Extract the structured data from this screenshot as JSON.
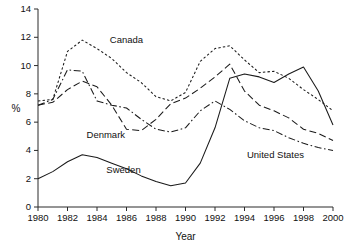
{
  "chart_data": {
    "type": "line",
    "title": "",
    "xlabel": "Year",
    "ylabel": "%",
    "xlim": [
      1980,
      2000
    ],
    "ylim": [
      0,
      14
    ],
    "grid": false,
    "legend_position": "inline-annotations",
    "x": [
      1980,
      1981,
      1982,
      1983,
      1984,
      1985,
      1986,
      1987,
      1988,
      1989,
      1990,
      1991,
      1992,
      1993,
      1994,
      1995,
      1996,
      1997,
      1998,
      1999,
      2000
    ],
    "xticks": [
      "1980",
      "1982",
      "1984",
      "1986",
      "1988",
      "1990",
      "1992",
      "1994",
      "1996",
      "1998",
      "2000"
    ],
    "yticks": [
      "0",
      "2",
      "4",
      "6",
      "8",
      "10",
      "12",
      "14"
    ],
    "series": [
      {
        "name": "Canada",
        "style": "dotted",
        "label": "Canada",
        "values": [
          7.5,
          7.6,
          11.0,
          11.8,
          11.2,
          10.5,
          9.5,
          8.8,
          7.8,
          7.5,
          8.1,
          10.3,
          11.2,
          11.4,
          10.4,
          9.5,
          9.6,
          9.1,
          8.3,
          7.6,
          6.8
        ]
      },
      {
        "name": "Denmark",
        "style": "dashed",
        "label": "Denmark",
        "values": [
          7.2,
          7.4,
          8.3,
          8.9,
          8.5,
          7.2,
          5.5,
          5.4,
          6.2,
          7.3,
          7.7,
          8.4,
          9.2,
          10.1,
          8.2,
          7.2,
          6.8,
          6.3,
          5.5,
          5.2,
          4.7
        ]
      },
      {
        "name": "United States",
        "style": "dashdot",
        "label": "United States",
        "values": [
          7.2,
          7.6,
          9.7,
          9.6,
          7.5,
          7.2,
          7.0,
          6.2,
          5.5,
          5.3,
          5.6,
          6.8,
          7.5,
          6.9,
          6.1,
          5.6,
          5.4,
          4.9,
          4.5,
          4.2,
          4.0
        ]
      },
      {
        "name": "Sweden",
        "style": "solid",
        "label": "Sweden",
        "values": [
          2.0,
          2.5,
          3.2,
          3.7,
          3.5,
          3.1,
          2.7,
          2.2,
          1.8,
          1.5,
          1.7,
          3.1,
          5.6,
          9.1,
          9.4,
          9.2,
          8.8,
          9.4,
          9.9,
          8.2,
          5.8
        ]
      }
    ],
    "annotations": [
      {
        "text": "Canada",
        "x": 1986.0,
        "y": 11.6
      },
      {
        "text": "Denmark",
        "x": 1984.6,
        "y": 4.85
      },
      {
        "text": "Sweden",
        "x": 1985.8,
        "y": 2.4
      },
      {
        "text": "United States",
        "x": 1996.1,
        "y": 3.5
      }
    ]
  }
}
